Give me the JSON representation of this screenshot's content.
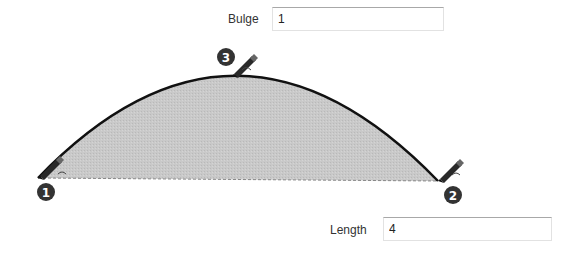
{
  "bulge": {
    "label": "Bulge",
    "value": "1"
  },
  "length": {
    "label": "Length",
    "value": "4"
  },
  "points": [
    {
      "number": "1",
      "icon": "pencil-icon"
    },
    {
      "number": "2",
      "icon": "pencil-icon"
    },
    {
      "number": "3",
      "icon": "pencil-icon"
    }
  ],
  "colors": {
    "arc_fill": "#c8c8c8",
    "arc_stroke": "#111111",
    "badge": "#333333"
  }
}
